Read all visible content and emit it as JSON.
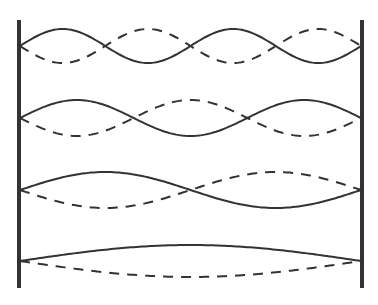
{
  "diagram": {
    "type": "standing-wave-harmonics",
    "colors": {
      "line": "#333333",
      "background": "#ffffff"
    },
    "walls": {
      "left_x": 19,
      "right_x": 362,
      "top_y": 20,
      "bottom_y": 288
    },
    "modes": [
      {
        "harmonic": 4,
        "half_wavelengths": 4,
        "center_y": 46,
        "amplitude": 17
      },
      {
        "harmonic": 3,
        "half_wavelengths": 3,
        "center_y": 118,
        "amplitude": 18
      },
      {
        "harmonic": 2,
        "half_wavelengths": 2,
        "center_y": 190,
        "amplitude": 18
      },
      {
        "harmonic": 1,
        "half_wavelengths": 1,
        "center_y": 261,
        "amplitude": 16
      }
    ]
  }
}
